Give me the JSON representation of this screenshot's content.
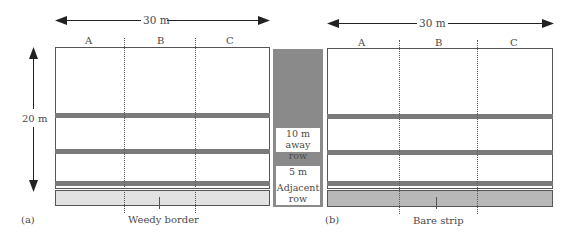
{
  "panel_a": {
    "label": "(a)",
    "width_label": "30 m",
    "height_label": "20 m",
    "columns": [
      "A",
      "B",
      "C"
    ],
    "border_label": "Weedy border",
    "border_color": "#e2e2e2"
  },
  "panel_b": {
    "label": "(b)",
    "width_label": "30 m",
    "columns": [
      "A",
      "B",
      "C"
    ],
    "border_label": "Bare strip",
    "border_color": "#b8b8b8"
  },
  "legend": {
    "items": [
      {
        "line1": "10 m",
        "line2": "away row"
      },
      {
        "line1": "5 m",
        "line2": "away row"
      },
      {
        "line1": "Adjacent",
        "line2": "row"
      }
    ]
  },
  "colors": {
    "row": "#7a7a7a",
    "legend_bg": "#8a8a8a"
  }
}
